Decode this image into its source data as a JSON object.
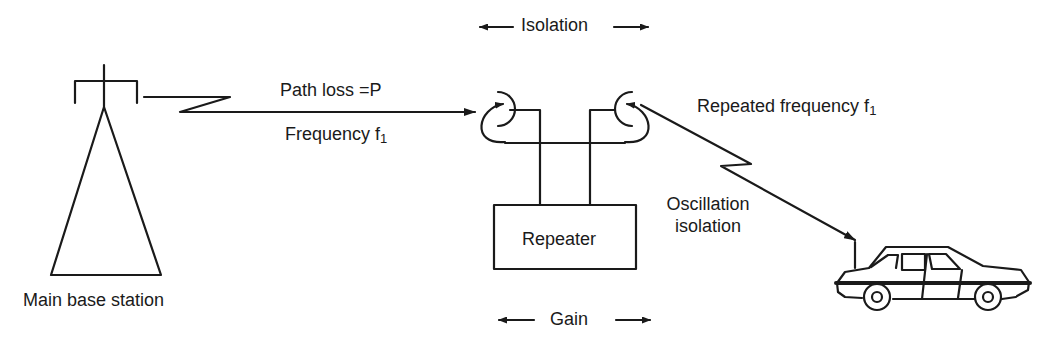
{
  "diagram": {
    "labels": {
      "isolation": "Isolation",
      "path_loss": "Path loss =P",
      "frequency": "Frequency f",
      "frequency_sub": "1",
      "repeated_frequency": "Repeated frequency f",
      "repeated_frequency_sub": "1",
      "repeater": "Repeater",
      "oscillation_line1": "Oscillation",
      "oscillation_line2": "isolation",
      "gain": "Gain",
      "main_base_station": "Main base station"
    },
    "nodes": [
      {
        "id": "base-station",
        "label": "Main base station"
      },
      {
        "id": "repeater",
        "label": "Repeater"
      },
      {
        "id": "car",
        "label": "Mobile unit"
      }
    ],
    "edges": [
      {
        "from": "base-station",
        "to": "repeater",
        "label": "Path loss =P / Frequency f1"
      },
      {
        "from": "repeater",
        "to": "car",
        "label": "Repeated frequency f1"
      }
    ],
    "colors": {
      "stroke": "#1a1a1a",
      "background": "#ffffff"
    }
  }
}
